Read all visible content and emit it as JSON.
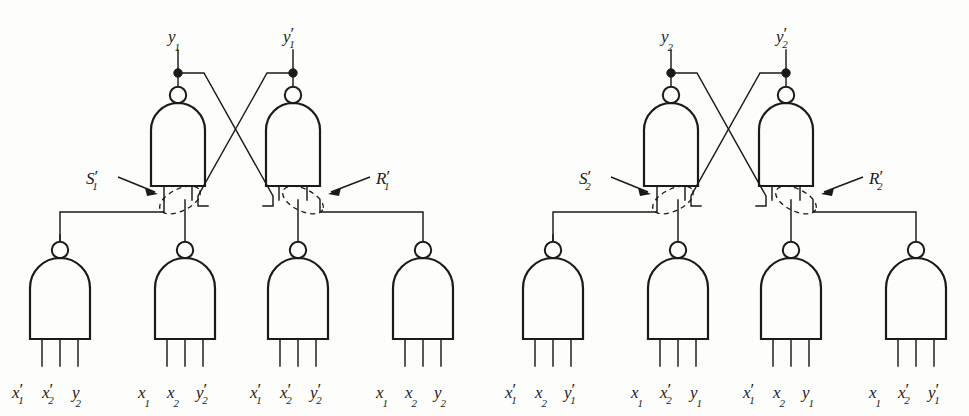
{
  "figure": {
    "background_color": "#fdfdfb",
    "line_color": "#1a1a1a"
  },
  "blocks": [
    {
      "id": "block-1",
      "top_inputs": [
        {
          "name": "y1",
          "base": "y",
          "sub": "1",
          "prime": ""
        },
        {
          "name": "y1p",
          "base": "y",
          "sub": "1",
          "prime": "′"
        }
      ],
      "latch_labels": [
        {
          "name": "S1p",
          "base": "S",
          "sub": "1",
          "prime": "′"
        },
        {
          "name": "R1p",
          "base": "R",
          "sub": "1",
          "prime": "′"
        }
      ],
      "bottom_gates": [
        {
          "index": 1,
          "inputs": [
            {
              "base": "x",
              "sub": "1",
              "prime": "′"
            },
            {
              "base": "x",
              "sub": "2",
              "prime": "′"
            },
            {
              "base": "y",
              "sub": "2",
              "prime": ""
            }
          ]
        },
        {
          "index": 2,
          "inputs": [
            {
              "base": "x",
              "sub": "1",
              "prime": ""
            },
            {
              "base": "x",
              "sub": "2",
              "prime": ""
            },
            {
              "base": "y",
              "sub": "2",
              "prime": "′"
            }
          ]
        },
        {
          "index": 3,
          "inputs": [
            {
              "base": "x",
              "sub": "1",
              "prime": "′"
            },
            {
              "base": "x",
              "sub": "2",
              "prime": "′"
            },
            {
              "base": "y",
              "sub": "2",
              "prime": "′"
            }
          ]
        },
        {
          "index": 4,
          "inputs": [
            {
              "base": "x",
              "sub": "1",
              "prime": ""
            },
            {
              "base": "x",
              "sub": "2",
              "prime": ""
            },
            {
              "base": "y",
              "sub": "2",
              "prime": ""
            }
          ]
        }
      ]
    },
    {
      "id": "block-2",
      "top_inputs": [
        {
          "name": "y2",
          "base": "y",
          "sub": "2",
          "prime": ""
        },
        {
          "name": "y2p",
          "base": "y",
          "sub": "2",
          "prime": "′"
        }
      ],
      "latch_labels": [
        {
          "name": "S2p",
          "base": "S",
          "sub": "2",
          "prime": "′"
        },
        {
          "name": "R2p",
          "base": "R",
          "sub": "2",
          "prime": "′"
        }
      ],
      "bottom_gates": [
        {
          "index": 1,
          "inputs": [
            {
              "base": "x",
              "sub": "1",
              "prime": "′"
            },
            {
              "base": "x",
              "sub": "2",
              "prime": ""
            },
            {
              "base": "y",
              "sub": "1",
              "prime": "′"
            }
          ]
        },
        {
          "index": 2,
          "inputs": [
            {
              "base": "x",
              "sub": "1",
              "prime": ""
            },
            {
              "base": "x",
              "sub": "2",
              "prime": "′"
            },
            {
              "base": "y",
              "sub": "1",
              "prime": ""
            }
          ]
        },
        {
          "index": 3,
          "inputs": [
            {
              "base": "x",
              "sub": "1",
              "prime": "′"
            },
            {
              "base": "x",
              "sub": "2",
              "prime": ""
            },
            {
              "base": "y",
              "sub": "1",
              "prime": ""
            }
          ]
        },
        {
          "index": 4,
          "inputs": [
            {
              "base": "x",
              "sub": "1",
              "prime": ""
            },
            {
              "base": "x",
              "sub": "2",
              "prime": "′"
            },
            {
              "base": "y",
              "sub": "1",
              "prime": "′"
            }
          ]
        }
      ]
    }
  ],
  "text_index": {
    "b1_top_0_base": "y",
    "b1_top_0_sub": "1",
    "b1_top_0_pr": "",
    "b1_top_1_base": "y",
    "b1_top_1_sub": "1",
    "b1_top_1_pr": "′",
    "b1_lat_0_base": "S",
    "b1_lat_0_sub": "1",
    "b1_lat_0_pr": "′",
    "b1_lat_1_base": "R",
    "b1_lat_1_sub": "1",
    "b1_lat_1_pr": "′",
    "b1_g1_i1_b": "x",
    "b1_g1_i1_s": "1",
    "b1_g1_i1_p": "′",
    "b1_g1_i2_b": "x",
    "b1_g1_i2_s": "2",
    "b1_g1_i2_p": "′",
    "b1_g1_i3_b": "y",
    "b1_g1_i3_s": "2",
    "b1_g1_i3_p": "",
    "b1_g2_i1_b": "x",
    "b1_g2_i1_s": "1",
    "b1_g2_i1_p": "",
    "b1_g2_i2_b": "x",
    "b1_g2_i2_s": "2",
    "b1_g2_i2_p": "",
    "b1_g2_i3_b": "y",
    "b1_g2_i3_s": "2",
    "b1_g2_i3_p": "′",
    "b1_g3_i1_b": "x",
    "b1_g3_i1_s": "1",
    "b1_g3_i1_p": "′",
    "b1_g3_i2_b": "x",
    "b1_g3_i2_s": "2",
    "b1_g3_i2_p": "′",
    "b1_g3_i3_b": "y",
    "b1_g3_i3_s": "2",
    "b1_g3_i3_p": "′",
    "b1_g4_i1_b": "x",
    "b1_g4_i1_s": "1",
    "b1_g4_i1_p": "",
    "b1_g4_i2_b": "x",
    "b1_g4_i2_s": "2",
    "b1_g4_i2_p": "",
    "b1_g4_i3_b": "y",
    "b1_g4_i3_s": "2",
    "b1_g4_i3_p": "",
    "b2_top_0_base": "y",
    "b2_top_0_sub": "2",
    "b2_top_0_pr": "",
    "b2_top_1_base": "y",
    "b2_top_1_sub": "2",
    "b2_top_1_pr": "′",
    "b2_lat_0_base": "S",
    "b2_lat_0_sub": "2",
    "b2_lat_0_pr": "′",
    "b2_lat_1_base": "R",
    "b2_lat_1_sub": "2",
    "b2_lat_1_pr": "′",
    "b2_g1_i1_b": "x",
    "b2_g1_i1_s": "1",
    "b2_g1_i1_p": "′",
    "b2_g1_i2_b": "x",
    "b2_g1_i2_s": "2",
    "b2_g1_i2_p": "",
    "b2_g1_i3_b": "y",
    "b2_g1_i3_s": "1",
    "b2_g1_i3_p": "′",
    "b2_g2_i1_b": "x",
    "b2_g2_i1_s": "1",
    "b2_g2_i1_p": "",
    "b2_g2_i2_b": "x",
    "b2_g2_i2_s": "2",
    "b2_g2_i2_p": "′",
    "b2_g2_i3_b": "y",
    "b2_g2_i3_s": "1",
    "b2_g2_i3_p": "",
    "b2_g3_i1_b": "x",
    "b2_g3_i1_s": "1",
    "b2_g3_i1_p": "′",
    "b2_g3_i2_b": "x",
    "b2_g3_i2_s": "2",
    "b2_g3_i2_p": "",
    "b2_g3_i3_b": "y",
    "b2_g3_i3_s": "1",
    "b2_g3_i3_p": "",
    "b2_g4_i1_b": "x",
    "b2_g4_i1_s": "1",
    "b2_g4_i1_p": "",
    "b2_g4_i2_b": "x",
    "b2_g4_i2_s": "2",
    "b2_g4_i2_p": "′",
    "b2_g4_i3_b": "y",
    "b2_g4_i3_s": "1",
    "b2_g4_i3_p": "′"
  }
}
